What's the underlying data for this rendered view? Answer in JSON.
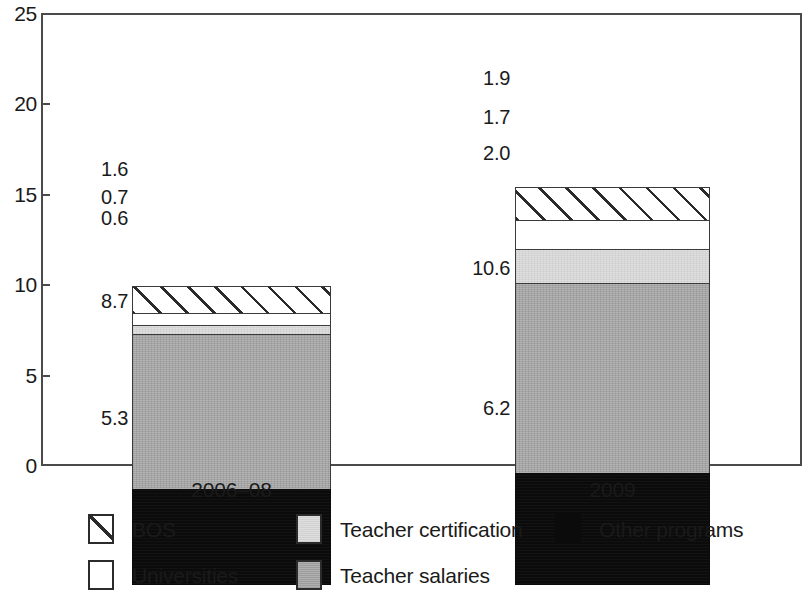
{
  "chart_data": {
    "type": "bar",
    "subtype": "stacked-bar",
    "title": "",
    "subtitle": "",
    "xlabel": "",
    "ylabel": "",
    "categories": [
      "2006–08",
      "2009"
    ],
    "ylim": [
      0,
      25
    ],
    "y_ticks": [
      "0",
      "5",
      "10",
      "15",
      "20",
      "25"
    ],
    "y_tick_values": [
      0,
      5,
      10,
      15,
      20,
      25
    ],
    "grid": false,
    "legend_position": "bottom",
    "stack_order_bottom_to_top": [
      "Other programs",
      "Teacher salaries",
      "Teacher certification",
      "Universities",
      "BOS"
    ],
    "series": [
      {
        "name": "Other programs",
        "swatch": "black",
        "color": "#0b0b0b",
        "values": [
          5.3,
          6.2
        ],
        "labels": [
          "5.3",
          "6.2"
        ]
      },
      {
        "name": "Teacher salaries",
        "swatch": "mgray",
        "color": "#a9a9a9",
        "values": [
          8.7,
          10.6
        ],
        "labels": [
          "8.7",
          "10.6"
        ]
      },
      {
        "name": "Teacher certification",
        "swatch": "lgray",
        "color": "#dcdcdc",
        "values": [
          0.6,
          2.0
        ],
        "labels": [
          "0.6",
          "2.0"
        ]
      },
      {
        "name": "Universities",
        "swatch": "white",
        "color": "#ffffff",
        "values": [
          0.7,
          1.7
        ],
        "labels": [
          "0.7",
          "1.7"
        ]
      },
      {
        "name": "BOS",
        "swatch": "hatch",
        "color": "#ffffff",
        "values": [
          1.6,
          1.9
        ],
        "labels": [
          "1.6",
          "1.9"
        ]
      }
    ],
    "totals": [
      16.9,
      22.4
    ],
    "legend": [
      {
        "name": "BOS",
        "swatch": "hatch"
      },
      {
        "name": "Teacher certification",
        "swatch": "lgray"
      },
      {
        "name": "Other programs",
        "swatch": "black"
      },
      {
        "name": "Universities",
        "swatch": "white"
      },
      {
        "name": "Teacher salaries",
        "swatch": "mgray"
      }
    ]
  },
  "axis": {
    "y_labels": [
      "25",
      "20",
      "15",
      "10",
      "5",
      "0"
    ]
  },
  "legend": {
    "items": [
      {
        "label": "BOS"
      },
      {
        "label": "Teacher certification"
      },
      {
        "label": "Other programs"
      },
      {
        "label": "Universities"
      },
      {
        "label": "Teacher salaries"
      }
    ]
  },
  "x_axis": {
    "labels": [
      {
        "label": "2006–08"
      },
      {
        "label": "2009"
      }
    ]
  }
}
